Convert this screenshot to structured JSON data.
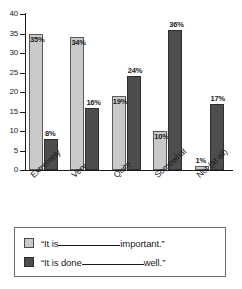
{
  "chart_data": {
    "type": "bar",
    "title": "",
    "xlabel": "",
    "ylabel": "",
    "ylim": [
      0,
      40
    ],
    "yticks": [
      0,
      5,
      10,
      15,
      20,
      25,
      30,
      35,
      40
    ],
    "ytick_labels": [
      "0",
      "5",
      "10",
      "15",
      "20",
      "25",
      "30",
      "35",
      "40"
    ],
    "grid": false,
    "legend_position": "bottom",
    "categories": [
      "Extremely",
      "Very",
      "Quite",
      "Somewhat",
      "Not (at all)"
    ],
    "series": [
      {
        "name": "“It is______________important.”",
        "color": "#c9c9c9",
        "values": [
          35,
          34,
          19,
          10,
          1
        ],
        "value_labels": [
          "35%",
          "34%",
          "19%",
          "10%",
          "1%"
        ],
        "label_placement": [
          "inside",
          "inside",
          "inside",
          "inside",
          "above"
        ]
      },
      {
        "name": "“It is done______________well.”",
        "color": "#4d4d4d",
        "values": [
          8,
          16,
          24,
          36,
          17
        ],
        "value_labels": [
          "8%",
          "16%",
          "24%",
          "36%",
          "17%"
        ],
        "label_placement": [
          "above",
          "above",
          "above",
          "above",
          "above"
        ]
      }
    ]
  },
  "legend": {
    "items": [
      {
        "swatch": "light",
        "prefix": "“It is",
        "suffix": "important.”"
      },
      {
        "swatch": "dark",
        "prefix": "“It is done",
        "suffix": "well.”"
      }
    ]
  }
}
